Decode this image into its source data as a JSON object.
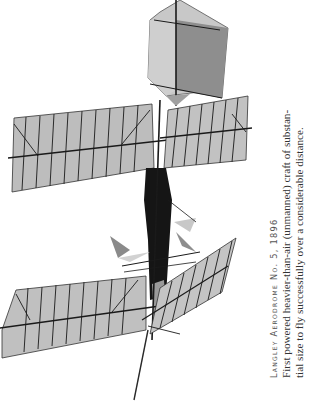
{
  "figure": {
    "colors": {
      "wing_fabric": "#b8b8b8",
      "wing_fabric_light": "#d0d0d0",
      "tail_dark": "#8e8e8e",
      "tail_light": "#c4c4c4",
      "frame": "#1a1a1a"
    }
  },
  "caption": {
    "title": "Langley Aerodrome No. 5, 1896",
    "lines": [
      "First powered heavier-than-air (unmanned) craft of substan-",
      "tial size to fly successfully over a considerable distance."
    ]
  }
}
